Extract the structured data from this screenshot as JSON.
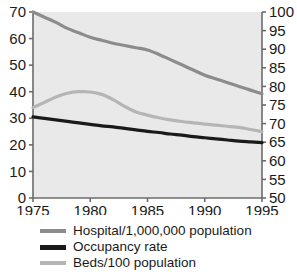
{
  "chart_data": {
    "type": "line",
    "title": "",
    "xlabel": "",
    "ylabel": "",
    "x": [
      1975,
      1976,
      1977,
      1978,
      1979,
      1980,
      1981,
      1982,
      1983,
      1984,
      1985,
      1986,
      1987,
      1988,
      1989,
      1990,
      1991,
      1992,
      1993,
      1994,
      1995
    ],
    "xlim": [
      1975,
      1995
    ],
    "xticks": [
      1975,
      1980,
      1985,
      1990,
      1995
    ],
    "xticklabels": [
      "1975",
      "1980",
      "1985",
      "1990",
      "1995"
    ],
    "left_axis": {
      "ylim": [
        0,
        70
      ],
      "yticks": [
        0,
        10,
        20,
        30,
        40,
        50,
        60,
        70
      ],
      "yticklabels": [
        "0",
        "10",
        "20",
        "30",
        "40",
        "50",
        "60",
        "70"
      ]
    },
    "right_axis": {
      "ylim": [
        50,
        100
      ],
      "yticks": [
        50,
        55,
        60,
        65,
        70,
        75,
        80,
        85,
        90,
        95,
        100
      ],
      "yticklabels": [
        "50",
        "55",
        "60",
        "65",
        "70",
        "75",
        "80",
        "85",
        "90",
        "95",
        "100"
      ]
    },
    "grid": false,
    "legend_position": "below",
    "series": [
      {
        "name": "Hospital/1,000,000 population",
        "color": "#8c8c8c",
        "width": 3.2,
        "axis": "right",
        "values": [
          100.0,
          98.6,
          97.2,
          95.6,
          94.4,
          93.2,
          92.4,
          91.6,
          91.0,
          90.4,
          89.8,
          88.6,
          87.2,
          85.8,
          84.4,
          83.0,
          82.0,
          81.0,
          80.0,
          79.0,
          78.0
        ],
        "values_left_scale": [
          70.0,
          68.1,
          66.0,
          63.8,
          62.2,
          60.4,
          59.4,
          58.3,
          57.4,
          56.6,
          55.8,
          54.1,
          52.1,
          50.2,
          48.2,
          46.2,
          44.8,
          43.4,
          42.0,
          40.6,
          39.2
        ]
      },
      {
        "name": "Occupancy rate",
        "color": "#1a1a1a",
        "width": 3.2,
        "axis": "right",
        "values": [
          71.8,
          71.4,
          71.0,
          70.6,
          70.2,
          69.8,
          69.4,
          69.1,
          68.7,
          68.3,
          67.9,
          67.6,
          67.2,
          66.9,
          66.5,
          66.2,
          65.9,
          65.6,
          65.3,
          65.1,
          64.9
        ],
        "values_left_scale": [
          30.5,
          30.0,
          29.5,
          28.9,
          28.4,
          27.9,
          27.4,
          26.9,
          26.4,
          25.9,
          25.5,
          25.0,
          24.6,
          24.2,
          23.8,
          23.4,
          23.1,
          22.8,
          22.5,
          22.3,
          22.1
        ]
      },
      {
        "name": "Beds/100 population",
        "color": "#b5b5b5",
        "width": 3.2,
        "axis": "left",
        "values": [
          34.0,
          36.0,
          38.0,
          39.4,
          40.0,
          39.9,
          39.0,
          37.0,
          34.5,
          32.4,
          31.2,
          30.2,
          29.4,
          28.8,
          28.3,
          27.8,
          27.4,
          27.0,
          26.6,
          25.8,
          25.0
        ]
      }
    ]
  },
  "legend": {
    "items": [
      {
        "label": "Hospital/1,000,000 population",
        "color": "#8c8c8c",
        "thick": false
      },
      {
        "label": "Occupancy rate",
        "color": "#1a1a1a",
        "thick": true
      },
      {
        "label": "Beds/100 population",
        "color": "#b5b5b5",
        "thick": false
      }
    ]
  },
  "style": {
    "plot_background": "#e9e9e9",
    "axis_color": "#6b6b6b",
    "page_background": "#ffffff",
    "text_color": "#1a1a1a"
  }
}
